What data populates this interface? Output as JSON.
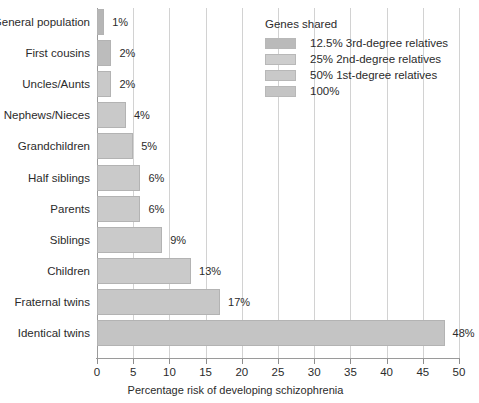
{
  "chart_data": {
    "type": "bar",
    "orientation": "horizontal",
    "title": "",
    "xlabel": "Percentage risk of developing schizophrenia",
    "ylabel": "",
    "xlim": [
      0,
      50
    ],
    "xticks": [
      0,
      5,
      10,
      15,
      20,
      25,
      30,
      35,
      40,
      45,
      50
    ],
    "grid": true,
    "grid_axis": "x",
    "legend_position": "top-right",
    "categories": [
      "General population",
      "First cousins",
      "Uncles/Aunts",
      "Nephews/Nieces",
      "Grandchildren",
      "Half siblings",
      "Parents",
      "Siblings",
      "Children",
      "Fraternal twins",
      "Identical twins"
    ],
    "values": [
      1,
      2,
      2,
      4,
      5,
      6,
      6,
      9,
      13,
      17,
      48
    ],
    "value_labels": [
      "1%",
      "2%",
      "2%",
      "4%",
      "5%",
      "6%",
      "6%",
      "9%",
      "13%",
      "17%",
      "48%"
    ],
    "bar_colors": [
      "#b6b6b6",
      "#bcbcbc",
      "#c9c9c9",
      "#c9c9c9",
      "#c9c9c9",
      "#cacaca",
      "#cacaca",
      "#cacaca",
      "#cacaca",
      "#c7c7c7",
      "#c4c4c4"
    ],
    "legend": {
      "title": "Genes shared",
      "entries": [
        {
          "label": "12.5% 3rd-degree relatives",
          "color": "#bababa"
        },
        {
          "label": "25% 2nd-degree relatives",
          "color": "#cdcdcd"
        },
        {
          "label": "50% 1st-degree relatives",
          "color": "#c9c9c9"
        },
        {
          "label": "100%",
          "color": "#c4c4c4"
        }
      ]
    }
  },
  "colors": {
    "grid": "#d2d2d2",
    "axis": "#9a9a9a",
    "text": "#2b2b2b",
    "bar_border": "#b3b3b3"
  }
}
